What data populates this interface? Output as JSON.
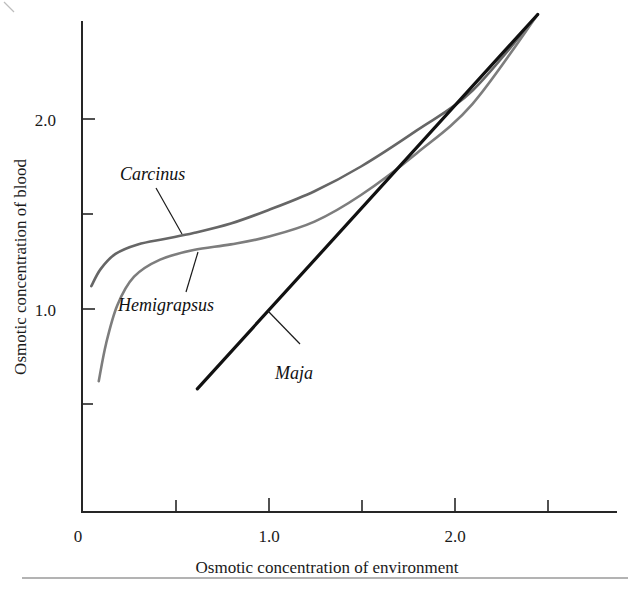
{
  "figure": {
    "background_color": "#ffffff",
    "has_bottom_rule": true
  },
  "chart_data": {
    "type": "line",
    "title": "",
    "xlabel": "Osmotic concentration of environment",
    "ylabel": "Osmotic concentration of blood",
    "xlim": [
      0,
      2.87
    ],
    "ylim": [
      0,
      2.58
    ],
    "grid": false,
    "legend_position": "inline-annotations",
    "x_ticks_labeled": [
      {
        "value": 0,
        "label": "0"
      },
      {
        "value": 1.0,
        "label": "1.0"
      },
      {
        "value": 2.0,
        "label": "2.0"
      }
    ],
    "x_ticks_minor": [
      0.5,
      1.5,
      2.5
    ],
    "y_ticks_labeled": [
      {
        "value": 1.0,
        "label": "1.0"
      },
      {
        "value": 2.0,
        "label": "2.0"
      }
    ],
    "y_ticks_minor": [
      0.5,
      1.5,
      2.5
    ],
    "series": [
      {
        "name": "Carcinus",
        "color": "#666666",
        "style": "hyperosmotic-regulator",
        "label_text": "Carcinus",
        "points": [
          {
            "x": 0.05,
            "y": 1.12
          },
          {
            "x": 0.1,
            "y": 1.21
          },
          {
            "x": 0.18,
            "y": 1.29
          },
          {
            "x": 0.3,
            "y": 1.34
          },
          {
            "x": 0.45,
            "y": 1.37
          },
          {
            "x": 0.6,
            "y": 1.4
          },
          {
            "x": 0.8,
            "y": 1.45
          },
          {
            "x": 1.0,
            "y": 1.52
          },
          {
            "x": 1.25,
            "y": 1.62
          },
          {
            "x": 1.5,
            "y": 1.75
          },
          {
            "x": 1.8,
            "y": 1.94
          },
          {
            "x": 2.1,
            "y": 2.15
          },
          {
            "x": 2.45,
            "y": 2.55
          }
        ]
      },
      {
        "name": "Hemigrapsus",
        "color": "#7d7d7d",
        "style": "hyperosmotic-regulator",
        "label_text": "Hemigrapsus",
        "points": [
          {
            "x": 0.09,
            "y": 0.62
          },
          {
            "x": 0.13,
            "y": 0.82
          },
          {
            "x": 0.19,
            "y": 1.02
          },
          {
            "x": 0.28,
            "y": 1.17
          },
          {
            "x": 0.42,
            "y": 1.26
          },
          {
            "x": 0.6,
            "y": 1.31
          },
          {
            "x": 0.8,
            "y": 1.34
          },
          {
            "x": 1.0,
            "y": 1.38
          },
          {
            "x": 1.25,
            "y": 1.46
          },
          {
            "x": 1.5,
            "y": 1.6
          },
          {
            "x": 1.8,
            "y": 1.82
          },
          {
            "x": 2.1,
            "y": 2.08
          },
          {
            "x": 2.45,
            "y": 2.55
          }
        ]
      },
      {
        "name": "Maja",
        "color": "#111111",
        "style": "osmoconformer",
        "label_text": "Maja",
        "points": [
          {
            "x": 0.62,
            "y": 0.58
          },
          {
            "x": 2.45,
            "y": 2.55
          }
        ]
      }
    ],
    "annotations": [
      {
        "text": "Carcinus",
        "label_x": 120,
        "label_y": 180,
        "leader_from": [
          156,
          188
        ],
        "leader_to": [
          182,
          234
        ]
      },
      {
        "text": "Hemigrapsus",
        "label_x": 118,
        "label_y": 311,
        "leader_from": [
          198,
          252
        ],
        "leader_to": [
          186,
          292
        ]
      },
      {
        "text": "Maja",
        "label_x": 275,
        "label_y": 379,
        "leader_from": [
          300,
          344
        ],
        "leader_to": [
          268,
          311
        ]
      }
    ]
  }
}
